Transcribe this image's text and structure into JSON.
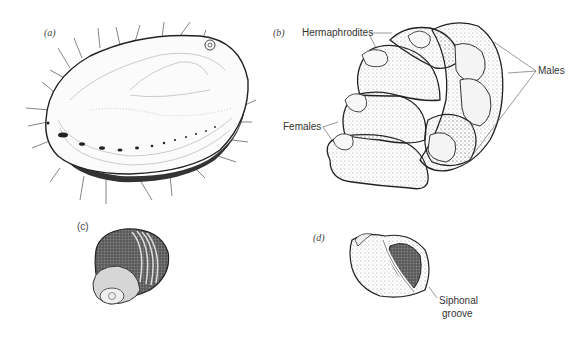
{
  "figure": {
    "panels": [
      {
        "id": "a",
        "label": "(a)",
        "subject": "abalone-shell"
      },
      {
        "id": "b",
        "label": "(b)",
        "subject": "slipper-limpet-stack",
        "annotations": [
          "Hermaphrodites",
          "Females",
          "Males"
        ]
      },
      {
        "id": "c",
        "label": "(c)",
        "subject": "banded-snail-shell"
      },
      {
        "id": "d",
        "label": "(d)",
        "subject": "snail-shell-aperture",
        "annotations": [
          "Siphonal groove"
        ]
      }
    ]
  },
  "labels": {
    "a": "(a)",
    "b": "(b)",
    "c": "(c)",
    "d": "(d)",
    "hermaphrodites": "Hermaphrodites",
    "females": "Females",
    "males": "Males",
    "siphonal_line1": "Siphonal",
    "siphonal_line2": "groove"
  }
}
